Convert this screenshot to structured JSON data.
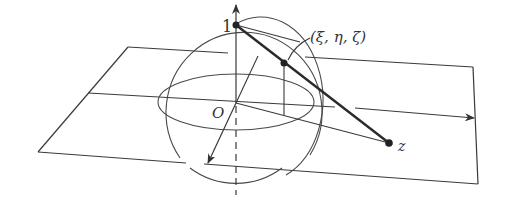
{
  "diagram": {
    "labels": {
      "north_pole": "1",
      "origin": "O",
      "sphere_point": "(ξ, η, ζ)",
      "plane_point": "z"
    },
    "colors": {
      "line": "#3a3a3a",
      "projection_line": "#2a2a2a",
      "background": "#ffffff"
    }
  }
}
